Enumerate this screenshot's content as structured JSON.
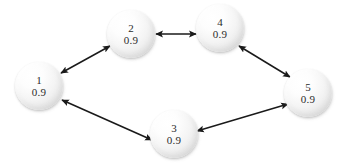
{
  "diagram": {
    "type": "node-link-graph",
    "background_color": "#ffffff",
    "edge_color": "#1a1a1a",
    "node_text_color": "#2b2b2b",
    "node_fill_light": "#ffffff",
    "node_fill_shadow": "#d2d2d2",
    "nodes": [
      {
        "id": "1",
        "value": "0.9",
        "cx": 39,
        "cy": 86,
        "r": 24
      },
      {
        "id": "2",
        "value": "0.9",
        "cx": 131,
        "cy": 34,
        "r": 24
      },
      {
        "id": "3",
        "value": "0.9",
        "cx": 174,
        "cy": 134,
        "r": 24
      },
      {
        "id": "4",
        "value": "0.9",
        "cx": 220,
        "cy": 28,
        "r": 24
      },
      {
        "id": "5",
        "value": "0.9",
        "cx": 308,
        "cy": 93,
        "r": 24
      }
    ],
    "edges": [
      {
        "from": "1",
        "to": "2",
        "direction": "bidirectional",
        "x1": 61,
        "y1": 73,
        "x2": 110,
        "y2": 46
      },
      {
        "from": "2",
        "to": "4",
        "direction": "bidirectional",
        "x1": 156,
        "y1": 34,
        "x2": 196,
        "y2": 34
      },
      {
        "from": "4",
        "to": "5",
        "direction": "bidirectional",
        "x1": 239,
        "y1": 46,
        "x2": 290,
        "y2": 77
      },
      {
        "from": "5",
        "to": "3",
        "direction": "bidirectional",
        "x1": 288,
        "y1": 104,
        "x2": 197,
        "y2": 131
      },
      {
        "from": "3",
        "to": "1",
        "direction": "bidirectional",
        "x1": 152,
        "y1": 140,
        "x2": 62,
        "y2": 100
      }
    ]
  }
}
